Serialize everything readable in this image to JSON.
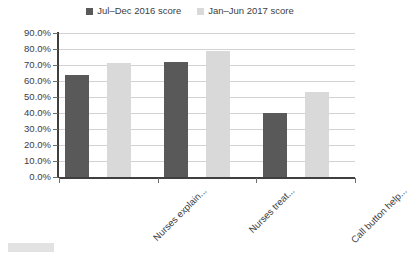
{
  "chart_data": {
    "type": "bar",
    "title": "",
    "xlabel": "",
    "ylabel": "",
    "categories": [
      "Nurses explain...",
      "Nurses treat...",
      "Call button help..."
    ],
    "series": [
      {
        "name": "Jul–Dec 2016 score",
        "color": "#595959",
        "values": [
          64.0,
          72.0,
          40.0
        ]
      },
      {
        "name": "Jan–Jun 2017 score",
        "color": "#d9d9d9",
        "values": [
          71.0,
          79.0,
          53.0
        ]
      }
    ],
    "ylim": [
      0,
      90
    ],
    "ytick_values": [
      90,
      80,
      70,
      60,
      50,
      40,
      30,
      20,
      10,
      0
    ],
    "ytick_labels": [
      "90.0%",
      "80.0%",
      "70.0%",
      "60.0%",
      "50.0%",
      "40.0%",
      "30.0%",
      "20.0%",
      "10.0%",
      "0.0%"
    ],
    "grid": "horizontal",
    "legend_position": "top-center",
    "xtick_label_rotation": -45
  },
  "legend": {
    "entries": [
      {
        "label": "Jul–Dec 2016 score",
        "color": "#595959"
      },
      {
        "label": "Jan–Jun 2017 score",
        "color": "#d9d9d9"
      }
    ]
  },
  "colors": {
    "series_1": "#595959",
    "series_2": "#d9d9d9",
    "gridline": "#d2d2d2",
    "axis": "#3f3f3f",
    "text": "#404040",
    "background": "#ffffff"
  }
}
